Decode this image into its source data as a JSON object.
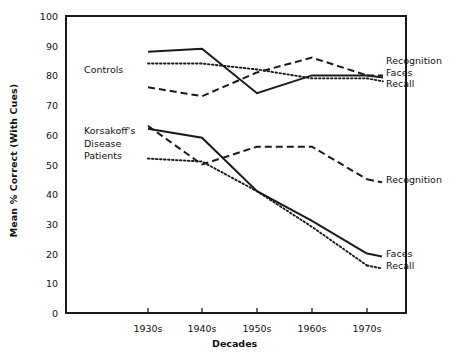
{
  "chart_data": {
    "type": "line",
    "title": "",
    "xlabel": "Decades",
    "ylabel": "Mean % Correct (With Cues)",
    "categories": [
      "1930s",
      "1940s",
      "1950s",
      "1960s",
      "1970s"
    ],
    "ylim": [
      0,
      100
    ],
    "yticks": [
      0,
      10,
      20,
      30,
      40,
      50,
      60,
      70,
      80,
      90,
      100
    ],
    "grid": false,
    "legend_position": "right-inline",
    "groups": [
      {
        "name": "Controls",
        "series": [
          {
            "name": "Recognition",
            "style": "dashed",
            "values": [
              76,
              73,
              81,
              86,
              80
            ]
          },
          {
            "name": "Faces",
            "style": "solid",
            "values": [
              88,
              89,
              74,
              80,
              80
            ]
          },
          {
            "name": "Recall",
            "style": "dotted",
            "values": [
              84,
              84,
              82,
              79,
              79
            ]
          }
        ]
      },
      {
        "name": "Korsakoff's Disease Patients",
        "series": [
          {
            "name": "Recognition",
            "style": "dashed",
            "values": [
              63,
              50,
              56,
              56,
              45
            ]
          },
          {
            "name": "Faces",
            "style": "solid",
            "values": [
              62,
              59,
              41,
              31,
              20
            ]
          },
          {
            "name": "Recall",
            "style": "dotted",
            "values": [
              52,
              51,
              41,
              29,
              16
            ]
          }
        ]
      }
    ],
    "annotations": {
      "controls_group_label": "Controls",
      "patients_group_label_line1": "Korsakoff's",
      "patients_group_label_line2": "Disease",
      "patients_group_label_line3": "Patients",
      "controls_labels": [
        "Recognition",
        "Faces",
        "Recall"
      ],
      "patients_recognition_label": "Recognition",
      "patients_faces_label": "Faces",
      "patients_recall_label": "Recall"
    },
    "colors": {
      "line": "#1a1a1a",
      "axis": "#1a1a1a",
      "text": "#111111",
      "background": "#ffffff"
    }
  }
}
